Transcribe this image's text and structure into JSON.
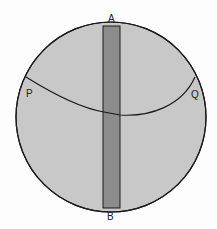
{
  "diagram": {
    "labels": {
      "top": "A",
      "bottom": "B",
      "left": "P",
      "right": "Q"
    },
    "colors": {
      "disc_fill": "#c8c8c8",
      "strip_fill": "#8c8c8c",
      "outline": "#1a1a1a"
    }
  }
}
